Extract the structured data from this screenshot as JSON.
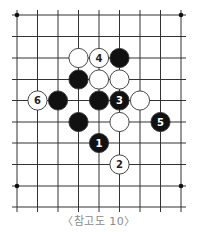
{
  "diagram": {
    "type": "go-board-fragment",
    "caption": "〈참고도 10〉",
    "grid": {
      "x": [
        17,
        37.5,
        58,
        78.5,
        99,
        119.5,
        140,
        160.5,
        181
      ],
      "y": [
        15,
        36.5,
        58,
        79.5,
        100.5,
        122,
        143,
        164.5,
        186,
        207
      ],
      "line_color": "#333333",
      "extend": 5
    },
    "star_points": [
      [
        0,
        0
      ],
      [
        8,
        0
      ],
      [
        0,
        8
      ],
      [
        8,
        8
      ]
    ],
    "stones": [
      {
        "col": 3,
        "row": 2,
        "color": "white",
        "label": ""
      },
      {
        "col": 4,
        "row": 2,
        "color": "white",
        "label": "4"
      },
      {
        "col": 5,
        "row": 2,
        "color": "black",
        "label": ""
      },
      {
        "col": 3,
        "row": 3,
        "color": "black",
        "label": ""
      },
      {
        "col": 4,
        "row": 3,
        "color": "white",
        "label": ""
      },
      {
        "col": 5,
        "row": 3,
        "color": "white",
        "label": ""
      },
      {
        "col": 1,
        "row": 4,
        "color": "white",
        "label": "6"
      },
      {
        "col": 2,
        "row": 4,
        "color": "black",
        "label": ""
      },
      {
        "col": 4,
        "row": 4,
        "color": "black",
        "label": ""
      },
      {
        "col": 5,
        "row": 4,
        "color": "black",
        "label": "3"
      },
      {
        "col": 6,
        "row": 4,
        "color": "white",
        "label": ""
      },
      {
        "col": 3,
        "row": 5,
        "color": "black",
        "label": ""
      },
      {
        "col": 5,
        "row": 5,
        "color": "white",
        "label": ""
      },
      {
        "col": 7,
        "row": 5,
        "color": "black",
        "label": "5"
      },
      {
        "col": 4,
        "row": 6,
        "color": "black",
        "label": "1"
      },
      {
        "col": 5,
        "row": 7,
        "color": "white",
        "label": "2"
      }
    ],
    "colors": {
      "black_stone": "#111111",
      "white_stone": "#ffffff",
      "stone_outline": "#333333",
      "white_label": "#222222",
      "black_label": "#ffffff",
      "caption": "#8a8a8a"
    }
  }
}
